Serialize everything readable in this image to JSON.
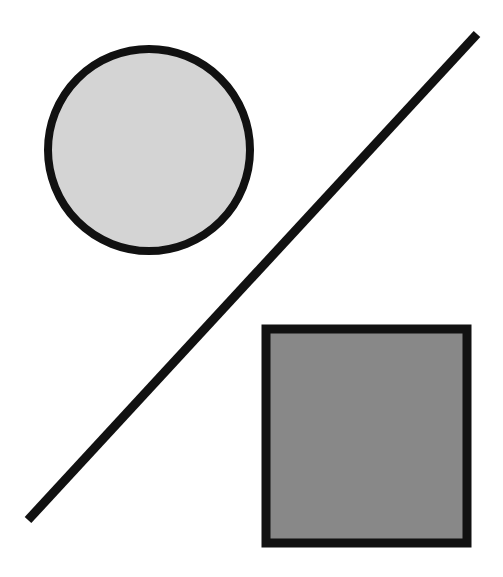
{
  "figure": {
    "canvas": {
      "width": 503,
      "height": 577,
      "background_color": "#ffffff"
    },
    "shapes": [
      {
        "id": "circle",
        "name": "circle",
        "label": "Circle",
        "geometry": {
          "center_x": 149,
          "center_y": 150,
          "radius": 101
        },
        "fill_color": "#d4d4d4",
        "stroke_color": "#111111",
        "stroke_width": 8
      },
      {
        "id": "line",
        "name": "diagonal-line",
        "label": "Diagonal Line",
        "geometry": {
          "x1": 28,
          "y1": 520,
          "x2": 477,
          "y2": 34
        },
        "fill_color": "none",
        "stroke_color": "#111111",
        "stroke_width": 9
      },
      {
        "id": "square",
        "name": "square",
        "label": "Square",
        "geometry": {
          "x": 266,
          "y": 329,
          "width": 201,
          "height": 214
        },
        "fill_color": "#888888",
        "stroke_color": "#111111",
        "stroke_width": 9
      }
    ]
  }
}
